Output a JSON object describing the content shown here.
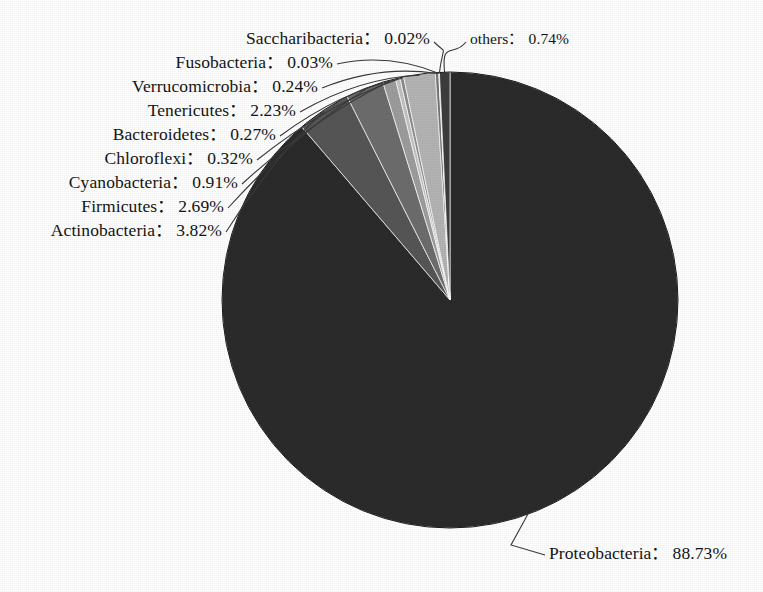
{
  "chart_data": {
    "type": "pie",
    "title": "",
    "subtitle": "",
    "xlabel": "",
    "ylabel": "",
    "legend_position": "none",
    "grid": false,
    "units": "%",
    "start_angle_deg": 0,
    "direction": "clockwise",
    "total": 100.0,
    "labels": [
      "Proteobacteria",
      "Actinobacteria",
      "Firmicutes",
      "Cyanobacteria",
      "Chloroflexi",
      "Bacteroidetes",
      "Tenericutes",
      "Verrucomicrobia",
      "Fusobacteria",
      "Saccharibacteria",
      "others"
    ],
    "values": [
      88.73,
      3.82,
      2.69,
      0.91,
      0.32,
      0.27,
      2.23,
      0.24,
      0.03,
      0.02,
      0.74
    ],
    "value_texts": [
      "88.73%",
      "3.82%",
      "2.69%",
      "0.91%",
      "0.32%",
      "0.27%",
      "2.23%",
      "0.24%",
      "0.03%",
      "0.02%",
      "0.74%"
    ],
    "colors": [
      "#2b2b2b",
      "#565656",
      "#6d6d6d",
      "#9d9d9d",
      "#c2c2c2",
      "#8c8c8c",
      "#b4b4b4",
      "#747474",
      "#d2d2d2",
      "#a6a6a6",
      "#3d3d3d"
    ],
    "separator": "："
  },
  "pie": {
    "center_x": 450,
    "center_y": 300,
    "radius": 228,
    "outline_color": "#1a1a1a"
  },
  "labels": {
    "separator": "：",
    "items": [
      {
        "name": "saccharibacteria",
        "text": "Saccharibacteria",
        "value": "0.02%",
        "x": 430,
        "y": 30,
        "align": "right",
        "size": "normal"
      },
      {
        "name": "others",
        "text": "others",
        "value": "0.74%",
        "x": 470,
        "y": 31,
        "align": "left",
        "size": "small"
      },
      {
        "name": "fusobacteria",
        "text": "Fusobacteria",
        "value": "0.03%",
        "x": 333,
        "y": 54,
        "align": "right",
        "size": "normal"
      },
      {
        "name": "verrucomicrobia",
        "text": "Verrucomicrobia",
        "value": "0.24%",
        "x": 318,
        "y": 78,
        "align": "right",
        "size": "normal"
      },
      {
        "name": "tenericutes",
        "text": "Tenericutes",
        "value": "2.23%",
        "x": 296,
        "y": 102,
        "align": "right",
        "size": "normal"
      },
      {
        "name": "bacteroidetes",
        "text": "Bacteroidetes",
        "value": "0.27%",
        "x": 276,
        "y": 126,
        "align": "right",
        "size": "normal"
      },
      {
        "name": "chloroflexi",
        "text": "Chloroflexi",
        "value": "0.32%",
        "x": 253,
        "y": 150,
        "align": "right",
        "size": "normal"
      },
      {
        "name": "cyanobacteria",
        "text": "Cyanobacteria",
        "value": "0.91%",
        "x": 238,
        "y": 174,
        "align": "right",
        "size": "normal"
      },
      {
        "name": "firmicutes",
        "text": "Firmicutes",
        "value": "2.69%",
        "x": 224,
        "y": 198,
        "align": "right",
        "size": "normal"
      },
      {
        "name": "actinobacteria",
        "text": "Actinobacteria",
        "value": "3.82%",
        "x": 222,
        "y": 222,
        "align": "right",
        "size": "normal"
      },
      {
        "name": "proteobacteria",
        "text": "Proteobacteria",
        "value": "88.73%",
        "x": 549,
        "y": 545,
        "align": "left",
        "size": "normal"
      }
    ]
  }
}
